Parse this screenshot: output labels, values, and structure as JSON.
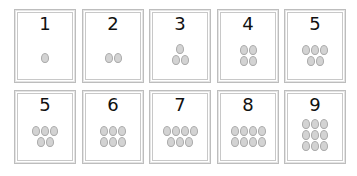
{
  "colors": {
    "card_border": "#bdbdbd",
    "egg_fill": "#d3d3d3",
    "egg_outline": "#a9a9a9",
    "numeral": "#111111"
  },
  "cards": [
    {
      "label": "1",
      "rows": [
        1
      ]
    },
    {
      "label": "2",
      "rows": [
        2
      ]
    },
    {
      "label": "3",
      "rows": [
        1,
        2
      ]
    },
    {
      "label": "4",
      "rows": [
        2,
        2
      ]
    },
    {
      "label": "5",
      "rows": [
        3,
        2
      ]
    },
    {
      "label": "5",
      "rows": [
        3,
        2
      ]
    },
    {
      "label": "6",
      "rows": [
        3,
        3
      ]
    },
    {
      "label": "7",
      "rows": [
        4,
        3
      ]
    },
    {
      "label": "8",
      "rows": [
        4,
        4
      ]
    },
    {
      "label": "9",
      "rows": [
        3,
        3,
        3
      ]
    }
  ]
}
